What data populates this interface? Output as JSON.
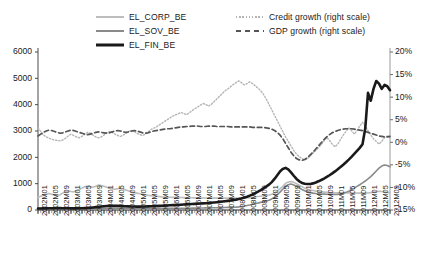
{
  "legend": {
    "left_items": [
      {
        "label": "EL_CORP_BE",
        "style": "solid-light-gray",
        "color": "#bdbdbd"
      },
      {
        "label": "EL_SOV_BE",
        "style": "solid-gray",
        "color": "#8a8a8a"
      },
      {
        "label": "EL_FIN_BE",
        "style": "solid-black-thick",
        "color": "#1a1a1a"
      }
    ],
    "right_items": [
      {
        "label": "Credit growth (right scale)",
        "style": "dotted-light-gray",
        "color": "#b5b5b5"
      },
      {
        "label": "GDP growth (right scale)",
        "style": "dashed-dark-gray",
        "color": "#555555"
      }
    ]
  },
  "chart_data": {
    "type": "line",
    "title": "",
    "xlabel": "",
    "ylabel": "",
    "grid": false,
    "legend_position": "top",
    "yaxis_left": {
      "ticks": [
        "0",
        "1000",
        "2000",
        "3000",
        "4000",
        "5000",
        "6000"
      ],
      "ylim": [
        0,
        6000
      ],
      "label": ""
    },
    "yaxis_right": {
      "ticks": [
        "-15%",
        "-10%",
        "-5%",
        "0%",
        "5%",
        "10%",
        "15%",
        "20%"
      ],
      "ylim": [
        -15,
        20
      ],
      "label": ""
    },
    "x_tick_labels": [
      "2002M01",
      "2002M05",
      "2002M09",
      "2003M01",
      "2003M05",
      "2003M09",
      "2004M01",
      "2004M05",
      "2004M09",
      "2005M01",
      "2005M05",
      "2005M09",
      "2006M01",
      "2006M05",
      "2006M09",
      "2007M01",
      "2007M05",
      "2007M09",
      "2008M01",
      "2008M05",
      "2008M09",
      "2009M01",
      "2009M05",
      "2009M09",
      "2010M01",
      "2010M05",
      "2010M09",
      "2011M01",
      "2011M05",
      "2011M09",
      "2012M01",
      "2012M05",
      "2012M09"
    ],
    "x_range": [
      "2002M01",
      "2012M09"
    ],
    "n_points": 129,
    "series": [
      {
        "name": "EL_CORP_BE",
        "axis": "left",
        "color": "#bdbdbd",
        "style": "solid",
        "width": 1.6,
        "values": [
          470,
          520,
          560,
          600,
          630,
          600,
          560,
          540,
          580,
          640,
          700,
          720,
          700,
          690,
          720,
          780,
          830,
          880,
          900,
          880,
          860,
          900,
          950,
          930,
          900,
          860,
          830,
          800,
          790,
          810,
          830,
          800,
          760,
          720,
          690,
          660,
          640,
          620,
          600,
          580,
          560,
          545,
          530,
          520,
          510,
          500,
          495,
          490,
          485,
          480,
          478,
          475,
          472,
          470,
          468,
          466,
          464,
          462,
          460,
          458,
          456,
          455,
          454,
          453,
          452,
          452,
          451,
          451,
          450,
          450,
          450,
          450,
          450,
          452,
          455,
          458,
          462,
          470,
          480,
          495,
          510,
          525,
          540,
          555,
          570,
          600,
          650,
          720,
          800,
          900,
          1010,
          1060,
          1080,
          1050,
          1000,
          940,
          880,
          830,
          790,
          760,
          740,
          720,
          700,
          690,
          680,
          672,
          665,
          660,
          655,
          652,
          650,
          648,
          646,
          645,
          644,
          643,
          642,
          640,
          640,
          640,
          645,
          660,
          680,
          700,
          710,
          700,
          685,
          670,
          660
        ]
      },
      {
        "name": "EL_SOV_BE",
        "axis": "left",
        "color": "#8a8a8a",
        "style": "solid",
        "width": 1.6,
        "values": [
          60,
          62,
          64,
          66,
          68,
          70,
          72,
          72,
          70,
          68,
          66,
          65,
          64,
          64,
          65,
          66,
          68,
          70,
          72,
          72,
          70,
          68,
          66,
          64,
          63,
          62,
          62,
          62,
          63,
          64,
          65,
          66,
          66,
          65,
          64,
          63,
          62,
          62,
          62,
          62,
          63,
          64,
          65,
          66,
          66,
          65,
          64,
          63,
          62,
          62,
          62,
          63,
          64,
          65,
          66,
          68,
          70,
          72,
          74,
          76,
          78,
          80,
          82,
          84,
          86,
          88,
          90,
          92,
          95,
          98,
          100,
          105,
          110,
          120,
          135,
          150,
          170,
          190,
          215,
          240,
          265,
          290,
          315,
          340,
          370,
          420,
          490,
          580,
          680,
          790,
          900,
          960,
          985,
          950,
          900,
          840,
          780,
          730,
          690,
          660,
          640,
          625,
          615,
          608,
          602,
          598,
          594,
          592,
          590,
          595,
          610,
          635,
          670,
          715,
          770,
          830,
          895,
          960,
          1030,
          1100,
          1180,
          1270,
          1370,
          1480,
          1590,
          1670,
          1710,
          1690,
          1640
        ]
      },
      {
        "name": "EL_FIN_BE",
        "axis": "left",
        "color": "#1a1a1a",
        "style": "solid",
        "width": 2.6,
        "values": [
          55,
          58,
          60,
          62,
          64,
          66,
          68,
          70,
          70,
          68,
          66,
          64,
          62,
          62,
          63,
          65,
          68,
          72,
          78,
          86,
          96,
          108,
          120,
          132,
          142,
          150,
          155,
          158,
          158,
          155,
          150,
          145,
          140,
          136,
          133,
          131,
          130,
          130,
          131,
          133,
          136,
          140,
          145,
          150,
          155,
          160,
          166,
          172,
          178,
          184,
          190,
          196,
          202,
          208,
          214,
          220,
          226,
          232,
          238,
          244,
          250,
          258,
          266,
          275,
          285,
          296,
          308,
          320,
          333,
          347,
          362,
          378,
          395,
          415,
          440,
          470,
          505,
          545,
          590,
          640,
          695,
          755,
          820,
          890,
          965,
          1060,
          1180,
          1320,
          1460,
          1560,
          1600,
          1540,
          1430,
          1300,
          1180,
          1090,
          1030,
          1000,
          985,
          990,
          1010,
          1045,
          1090,
          1140,
          1195,
          1255,
          1320,
          1390,
          1465,
          1545,
          1630,
          1720,
          1815,
          1915,
          2020,
          2130,
          2245,
          2360,
          2500,
          3100,
          4450,
          4150,
          4600,
          4900,
          4800,
          4600,
          4750,
          4700,
          4550
        ]
      },
      {
        "name": "Credit growth (right scale)",
        "axis": "right",
        "color": "#b5b5b5",
        "style": "dotted",
        "width": 1.4,
        "values": [
          3.2,
          2.4,
          1.6,
          1.2,
          0.9,
          0.7,
          0.5,
          0.4,
          0.3,
          0.5,
          0.9,
          1.4,
          1.8,
          1.5,
          1.2,
          1.0,
          1.3,
          1.8,
          2.2,
          2.0,
          1.6,
          1.2,
          1.0,
          1.2,
          1.6,
          2.1,
          2.4,
          2.2,
          1.8,
          1.5,
          1.3,
          1.6,
          2.0,
          2.4,
          2.6,
          2.4,
          2.0,
          1.7,
          1.5,
          1.8,
          2.3,
          2.8,
          3.1,
          3.4,
          3.8,
          4.2,
          4.6,
          5.0,
          5.4,
          5.8,
          6.1,
          6.3,
          6.6,
          6.4,
          6.1,
          6.5,
          7.0,
          7.4,
          7.8,
          8.2,
          8.6,
          8.4,
          8.0,
          8.4,
          9.0,
          9.6,
          10.2,
          10.8,
          11.4,
          11.8,
          12.3,
          12.8,
          13.2,
          13.6,
          13.2,
          12.7,
          13.0,
          13.4,
          13.0,
          12.5,
          12.0,
          11.4,
          10.6,
          9.6,
          8.4,
          7.2,
          6.0,
          4.8,
          3.6,
          2.4,
          1.2,
          0.2,
          -0.8,
          -1.8,
          -2.6,
          -3.2,
          -3.6,
          -3.9,
          -3.6,
          -3.0,
          -2.4,
          -1.8,
          -1.2,
          -0.5,
          0.3,
          1.1,
          0.4,
          -0.4,
          -1.0,
          -0.4,
          0.6,
          1.6,
          2.4,
          3.2,
          2.6,
          1.8,
          2.6,
          3.6,
          4.4,
          3.6,
          2.6,
          1.6,
          0.8,
          0.2,
          -0.4,
          0.2,
          1.0,
          1.4,
          1.0
        ]
      },
      {
        "name": "GDP growth (right scale)",
        "axis": "right",
        "color": "#555555",
        "style": "dashed",
        "width": 1.7,
        "values": [
          1.4,
          1.8,
          2.2,
          2.5,
          2.7,
          2.6,
          2.4,
          2.2,
          2.0,
          2.1,
          2.3,
          2.5,
          2.7,
          2.6,
          2.4,
          2.2,
          2.0,
          1.8,
          1.7,
          1.8,
          2.0,
          2.2,
          2.3,
          2.2,
          2.1,
          2.0,
          2.1,
          2.3,
          2.5,
          2.6,
          2.5,
          2.3,
          2.2,
          2.3,
          2.5,
          2.6,
          2.5,
          2.3,
          2.1,
          2.0,
          2.1,
          2.3,
          2.5,
          2.6,
          2.7,
          2.8,
          2.9,
          3.0,
          3.0,
          3.1,
          3.2,
          3.3,
          3.4,
          3.4,
          3.5,
          3.5,
          3.6,
          3.6,
          3.6,
          3.5,
          3.5,
          3.5,
          3.6,
          3.6,
          3.6,
          3.5,
          3.5,
          3.5,
          3.5,
          3.5,
          3.4,
          3.4,
          3.4,
          3.4,
          3.4,
          3.4,
          3.4,
          3.4,
          3.3,
          3.3,
          3.3,
          3.3,
          3.3,
          3.2,
          3.1,
          2.9,
          2.6,
          2.2,
          1.6,
          0.8,
          -0.2,
          -1.2,
          -2.2,
          -3.0,
          -3.6,
          -3.9,
          -4.0,
          -3.8,
          -3.4,
          -2.8,
          -2.2,
          -1.5,
          -0.8,
          -0.1,
          0.6,
          1.2,
          1.7,
          2.1,
          2.4,
          2.6,
          2.8,
          2.9,
          3.0,
          3.0,
          3.0,
          2.9,
          2.8,
          2.7,
          2.6,
          2.4,
          2.2,
          2.0,
          1.8,
          1.6,
          1.4,
          1.3,
          1.2,
          1.2,
          1.3
        ]
      }
    ]
  }
}
